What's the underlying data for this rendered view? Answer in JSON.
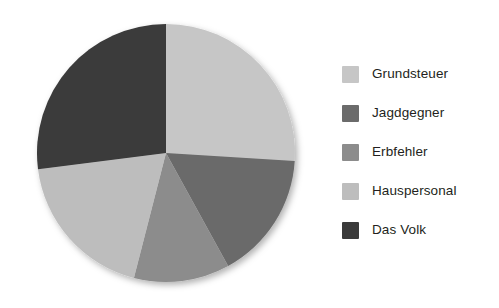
{
  "chart_data": {
    "type": "pie",
    "title": "",
    "subtitle": "",
    "xlabel": "",
    "ylabel": "",
    "grid": false,
    "legend_position": "right",
    "start_angle_deg": 0,
    "direction": "clockwise",
    "categories": [
      "Grundsteuer",
      "Jagdgegner",
      "Erbfehler",
      "Hauspersonal",
      "Das Volk"
    ],
    "values": [
      26,
      16,
      12,
      19,
      27
    ],
    "units": "percent",
    "colors": [
      "#c6c6c6",
      "#6b6b6b",
      "#8c8c8c",
      "#bdbdbd",
      "#3a3a3a"
    ],
    "slices": [
      {
        "label": "Grundsteuer",
        "value": 26,
        "color": "#c6c6c6",
        "start_deg": 0,
        "end_deg": 93.6
      },
      {
        "label": "Jagdgegner",
        "value": 16,
        "color": "#6b6b6b",
        "start_deg": 93.6,
        "end_deg": 151.2
      },
      {
        "label": "Erbfehler",
        "value": 12,
        "color": "#8c8c8c",
        "start_deg": 151.2,
        "end_deg": 194.4
      },
      {
        "label": "Hauspersonal",
        "value": 19,
        "color": "#bdbdbd",
        "start_deg": 194.4,
        "end_deg": 262.8
      },
      {
        "label": "Das Volk",
        "value": 27,
        "color": "#3a3a3a",
        "start_deg": 262.8,
        "end_deg": 360
      }
    ]
  },
  "legend": {
    "items": [
      {
        "label": "Grundsteuer",
        "color": "#c6c6c6",
        "swatch_name": "legend-swatch-grundsteuer"
      },
      {
        "label": "Jagdgegner",
        "color": "#6b6b6b",
        "swatch_name": "legend-swatch-jagdgegner"
      },
      {
        "label": "Erbfehler",
        "color": "#8c8c8c",
        "swatch_name": "legend-swatch-erbfehler"
      },
      {
        "label": "Hauspersonal",
        "color": "#bdbdbd",
        "swatch_name": "legend-swatch-hauspersonal"
      },
      {
        "label": "Das Volk",
        "color": "#3a3a3a",
        "swatch_name": "legend-swatch-das-volk"
      }
    ]
  }
}
